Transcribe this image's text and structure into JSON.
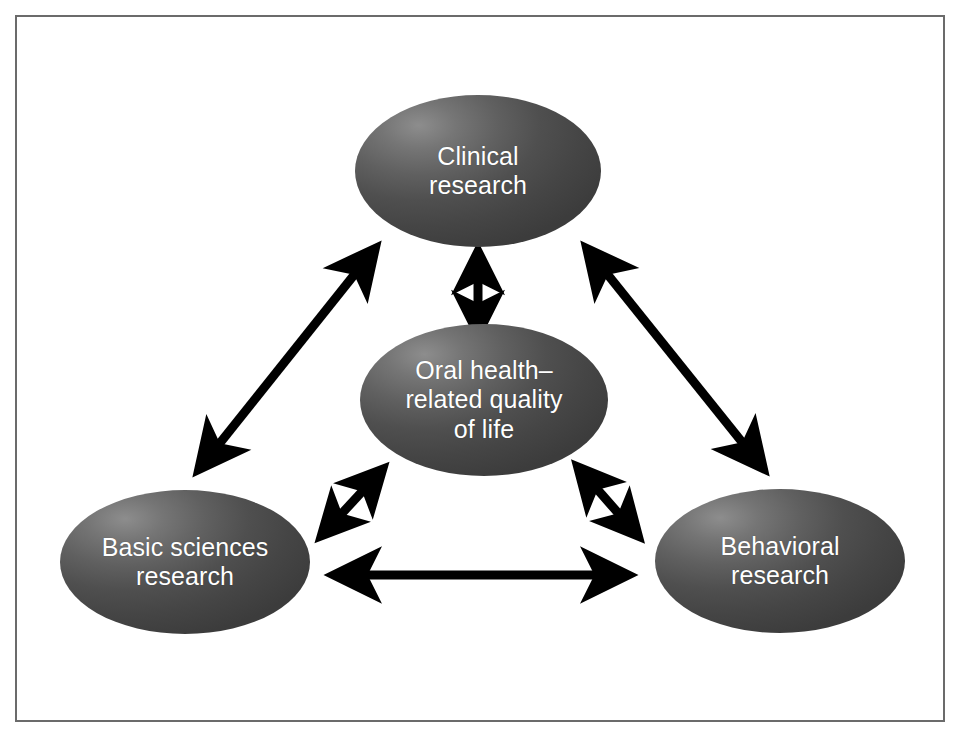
{
  "figure": {
    "type": "concept-diagram",
    "background_color": "#ffffff",
    "frame_border_color": "#6b6b6b",
    "node_fill_dark": "#3c3c3c",
    "node_fill_light": "#8d8d8d",
    "node_text_color": "#ffffff",
    "arrow_color": "#000000"
  },
  "nodes": [
    {
      "id": "clinical",
      "label": "Clinical\nresearch",
      "line1": "Clinical",
      "line2": "research",
      "position": "top-center"
    },
    {
      "id": "center",
      "label": "Oral health–\nrelated quality\nof life",
      "line1": "Oral health–",
      "line2": "related quality",
      "line3": "of life",
      "position": "center"
    },
    {
      "id": "basic",
      "label": "Basic sciences\nresearch",
      "line1": "Basic sciences",
      "line2": "research",
      "position": "bottom-left"
    },
    {
      "id": "behavioral",
      "label": "Behavioral\nresearch",
      "line1": "Behavioral",
      "line2": "research",
      "position": "bottom-right"
    }
  ],
  "connections": [
    {
      "id": "basic-clinical",
      "from": "basic",
      "to": "clinical",
      "style": "double-headed-arrow",
      "weight": "thick"
    },
    {
      "id": "clinical-behavioral",
      "from": "clinical",
      "to": "behavioral",
      "style": "double-headed-arrow",
      "weight": "thick"
    },
    {
      "id": "basic-behavioral",
      "from": "basic",
      "to": "behavioral",
      "style": "double-headed-arrow",
      "weight": "thick"
    },
    {
      "id": "clinical-center",
      "from": "clinical",
      "to": "center",
      "style": "double-headed-arrow",
      "weight": "short"
    },
    {
      "id": "basic-center",
      "from": "basic",
      "to": "center",
      "style": "double-headed-arrow",
      "weight": "short"
    },
    {
      "id": "behavioral-center",
      "from": "behavioral",
      "to": "center",
      "style": "double-headed-arrow",
      "weight": "short"
    }
  ]
}
